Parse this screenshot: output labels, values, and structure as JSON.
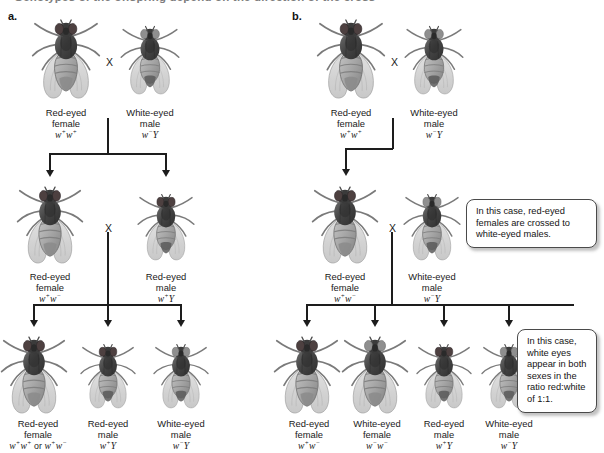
{
  "figure": {
    "clipped_header_text": "Genotypes of the offspring depend on the direction of the cross",
    "panel_a_letter": "a.",
    "panel_b_letter": "b.",
    "cross_symbol": "X"
  },
  "colors": {
    "line": "#1d1d1d",
    "text": "#1a1a1a",
    "fly_body_dark": "#4a4a4a",
    "fly_body_mid": "#6e6e6e",
    "fly_wing": "#c9c9c9",
    "callout_border": "#4a4a4a",
    "background": "#ffffff"
  },
  "panel_a": {
    "generations": [
      {
        "name": "P",
        "flies": [
          {
            "sex": "female",
            "eye": "red",
            "line1": "Red-eyed",
            "line2": "female",
            "genotype": "w+w+"
          },
          {
            "sex": "male",
            "eye": "white",
            "line1": "White-eyed",
            "line2": "male",
            "genotype": "w-Y"
          }
        ]
      },
      {
        "name": "F1",
        "flies": [
          {
            "sex": "female",
            "eye": "red",
            "line1": "Red-eyed",
            "line2": "female",
            "genotype": "w+w-"
          },
          {
            "sex": "male",
            "eye": "red",
            "line1": "Red-eyed",
            "line2": "male",
            "genotype": "w+Y"
          }
        ]
      },
      {
        "name": "F2",
        "flies": [
          {
            "sex": "female",
            "eye": "red",
            "line1": "Red-eyed",
            "line2": "female",
            "genotype": "w+w+ or w+w-"
          },
          {
            "sex": "male",
            "eye": "red",
            "line1": "Red-eyed",
            "line2": "male",
            "genotype": "w+Y"
          },
          {
            "sex": "male",
            "eye": "white",
            "line1": "White-eyed",
            "line2": "male",
            "genotype": "w-Y"
          }
        ]
      }
    ]
  },
  "panel_b": {
    "generations": [
      {
        "name": "P",
        "flies": [
          {
            "sex": "female",
            "eye": "red",
            "line1": "Red-eyed",
            "line2": "female",
            "genotype": "w+w+"
          },
          {
            "sex": "male",
            "eye": "white",
            "line1": "White-eyed",
            "line2": "male",
            "genotype": "w-Y"
          }
        ]
      },
      {
        "name": "F1",
        "flies": [
          {
            "sex": "female",
            "eye": "red",
            "line1": "Red-eyed",
            "line2": "female",
            "genotype": "w+w-"
          },
          {
            "sex": "male",
            "eye": "white",
            "line1": "White-eyed",
            "line2": "male",
            "genotype": "w-Y"
          }
        ]
      },
      {
        "name": "F2",
        "flies": [
          {
            "sex": "female",
            "eye": "red",
            "line1": "Red-eyed",
            "line2": "female",
            "genotype": "w+w-"
          },
          {
            "sex": "female",
            "eye": "white",
            "line1": "White-eyed",
            "line2": "female",
            "genotype": "w-w-"
          },
          {
            "sex": "male",
            "eye": "red",
            "line1": "Red-eyed",
            "line2": "male",
            "genotype": "w+Y"
          },
          {
            "sex": "male",
            "eye": "white",
            "line1": "White-eyed",
            "line2": "male",
            "genotype": "w-Y"
          }
        ]
      }
    ],
    "callouts": [
      {
        "id": "callout-cross",
        "text": "In this case, red-eyed females are crossed to white-eyed males."
      },
      {
        "id": "callout-ratio",
        "text": "In this case, white eyes appear in both sexes in the ratio red:white of 1:1."
      }
    ]
  }
}
